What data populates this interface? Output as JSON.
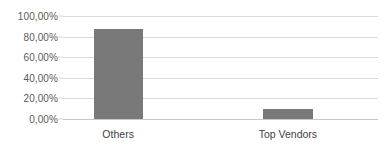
{
  "chart_data": {
    "type": "bar",
    "title": "",
    "subtitle": "",
    "xlabel": "",
    "ylabel": "",
    "categories": [
      "Others",
      "Top Vendors"
    ],
    "values": [
      87.0,
      9.7
    ],
    "value_labels": [
      "87,00%",
      "9,70%"
    ],
    "ylim": [
      0,
      100
    ],
    "y_ticks": [
      0,
      20,
      40,
      60,
      80,
      100
    ],
    "y_tick_labels": [
      "0,00%",
      "20,00%",
      "40,00%",
      "60,00%",
      "80,00%",
      "100,00%"
    ],
    "grid": true,
    "legend": false,
    "legend_position": "none",
    "series": [
      {
        "name": "Share",
        "values": [
          87.0,
          9.7
        ],
        "color": "#797979"
      }
    ],
    "colors": {
      "bar": "#797979",
      "gridline": "#d9d9d9",
      "baseline": "#c9c9c9",
      "y_tick_text": "#595959",
      "x_tick_text": "#3f3f3f",
      "background": "#ffffff"
    },
    "bar_geometry": [
      {
        "category": "Others",
        "center_pct": 17.5,
        "width_pct": 15.6
      },
      {
        "category": "Top Vendors",
        "center_pct": 71.4,
        "width_pct": 15.9
      }
    ]
  }
}
